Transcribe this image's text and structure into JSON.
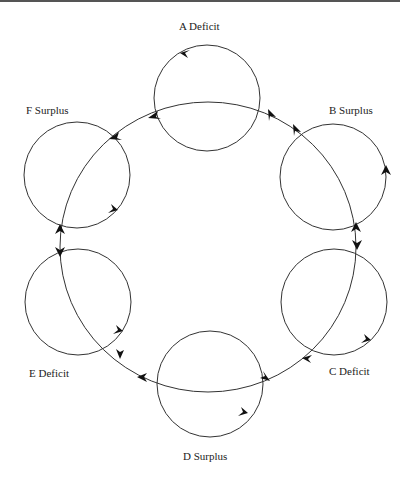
{
  "diagram": {
    "type": "cycle-of-circles",
    "line_color": "#333333",
    "nodes": [
      {
        "id": "A",
        "label": "A  Deficit",
        "letter": "A",
        "state": "Deficit",
        "cx": 207,
        "cy": 98,
        "r": 53
      },
      {
        "id": "B",
        "label": "B  Surplus",
        "letter": "B",
        "state": "Surplus",
        "cx": 333,
        "cy": 177,
        "r": 53
      },
      {
        "id": "C",
        "label": "C  Deficit",
        "letter": "C",
        "state": "Deficit",
        "cx": 334,
        "cy": 302,
        "r": 53
      },
      {
        "id": "D",
        "label": "D  Surplus",
        "letter": "D",
        "state": "Surplus",
        "cx": 210,
        "cy": 384,
        "r": 53
      },
      {
        "id": "E",
        "label": "E  Deficit",
        "letter": "E",
        "state": "Deficit",
        "cx": 78,
        "cy": 302,
        "r": 53
      },
      {
        "id": "F",
        "label": "F  Surplus",
        "letter": "F",
        "state": "Surplus",
        "cx": 77,
        "cy": 175,
        "r": 53
      }
    ],
    "outer_ring": {
      "cx": 208,
      "cy": 247,
      "rx": 148,
      "ry": 145
    }
  }
}
